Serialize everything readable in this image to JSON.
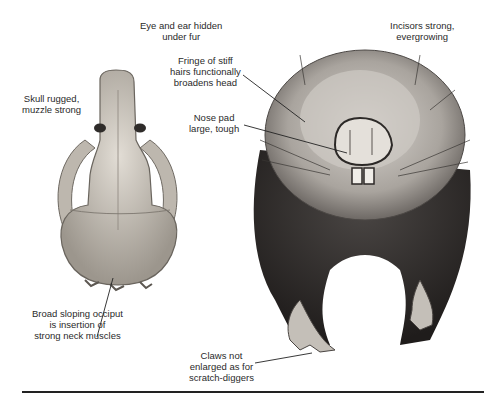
{
  "figure": {
    "caption_visible": "clipped",
    "labels": {
      "eye_ear": [
        "Eye and ear hidden",
        "under fur"
      ],
      "skull": [
        "Skull rugged,",
        "muzzle strong"
      ],
      "fringe": [
        "Fringe of stiff",
        "hairs functionally",
        "broadens head"
      ],
      "nose": [
        "Nose pad",
        "large, tough"
      ],
      "incisors": [
        "Incisors strong,",
        "evergrowing"
      ],
      "occiput": [
        "Broad sloping occiput",
        "is insertion of",
        "strong neck muscles"
      ],
      "claws": [
        "Claws not",
        "enlarged as for",
        "scratch-diggers"
      ]
    },
    "colors": {
      "bone_light": "#d9d4cc",
      "bone_dark": "#8a847c",
      "fur_dark": "#2e2b2a",
      "fur_light": "#b9b4ae",
      "rule": "#222222"
    }
  }
}
